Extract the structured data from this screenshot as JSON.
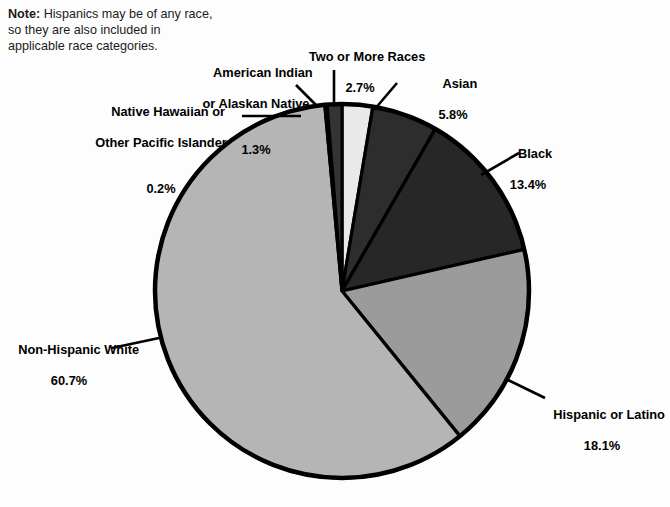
{
  "note": {
    "lead": "Note:",
    "text": " Hispanics may be of any race, so they are also included in applicable race categories."
  },
  "chart_data": {
    "type": "pie",
    "title": "",
    "subtitle": "",
    "xlabel": "",
    "ylabel": "",
    "legend_position": "callout-labels",
    "grid": false,
    "start_angle_deg": 0,
    "direction": "clockwise",
    "center": {
      "x": 342,
      "y": 291
    },
    "radius": 187,
    "note": "Note: Hispanics may be of any race, so they are also included in applicable race categories.",
    "categories": [
      "Two or More Races",
      "Asian",
      "Black",
      "Hispanic or Latino",
      "Non-Hispanic White",
      "Native Hawaiian or Other Pacific Islander",
      "American Indian or Alaskan Native"
    ],
    "values": [
      2.7,
      5.8,
      13.4,
      18.1,
      60.7,
      0.2,
      1.3
    ],
    "value_labels": [
      "2.7%",
      "5.8%",
      "13.4%",
      "18.1%",
      "60.7%",
      "0.2%",
      "1.3%"
    ],
    "colors": [
      "#e9e9e9",
      "#2d2d2d",
      "#272727",
      "#9b9b9b",
      "#b5b5b5",
      "#c8c8c8",
      "#343434"
    ],
    "slices": [
      {
        "id": "two-or-more-races",
        "label_line1": "Two or More Races",
        "label_line2": "",
        "percent": "2.7%",
        "value": 2.7,
        "color": "#e9e9e9"
      },
      {
        "id": "asian",
        "label_line1": "Asian",
        "label_line2": "",
        "percent": "5.8%",
        "value": 5.8,
        "color": "#2d2d2d"
      },
      {
        "id": "black",
        "label_line1": "Black",
        "label_line2": "",
        "percent": "13.4%",
        "value": 13.4,
        "color": "#272727"
      },
      {
        "id": "hispanic-or-latino",
        "label_line1": "Hispanic or Latino",
        "label_line2": "",
        "percent": "18.1%",
        "value": 18.1,
        "color": "#9b9b9b"
      },
      {
        "id": "non-hispanic-white",
        "label_line1": "Non-Hispanic White",
        "label_line2": "",
        "percent": "60.7%",
        "value": 60.7,
        "color": "#b5b5b5"
      },
      {
        "id": "native-hawaiian-pacific-islander",
        "label_line1": "Native Hawaiian or",
        "label_line2": "Other Pacific Islander",
        "percent": "0.2%",
        "value": 0.2,
        "color": "#c8c8c8"
      },
      {
        "id": "american-indian-alaskan-native",
        "label_line1": "American Indian",
        "label_line2": "or Alaskan Native",
        "percent": "1.3%",
        "value": 1.3,
        "color": "#343434"
      }
    ]
  },
  "labels": {
    "two_or_more_races": {
      "name": "Two or More Races",
      "pct": "2.7%"
    },
    "american_indian": {
      "line1": "American Indian",
      "line2": "or Alaskan Native",
      "pct": "1.3%"
    },
    "native_hawaiian": {
      "line1": "Native Hawaiian or",
      "line2": "Other Pacific Islander",
      "pct": "0.2%"
    },
    "asian": {
      "name": "Asian",
      "pct": "5.8%"
    },
    "black": {
      "name": "Black",
      "pct": "13.4%"
    },
    "hispanic": {
      "name": "Hispanic or Latino",
      "pct": "18.1%"
    },
    "non_hispanic_white": {
      "name": "Non-Hispanic White",
      "pct": "60.7%"
    }
  }
}
